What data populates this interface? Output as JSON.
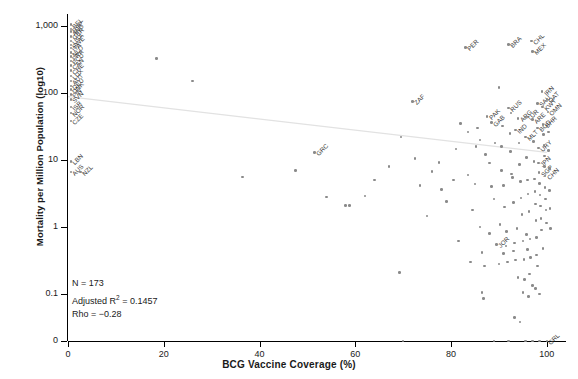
{
  "chart_data": {
    "type": "scatter",
    "title": "",
    "xlabel": "BCG Vaccine Coverage (%)",
    "ylabel": "Mortality per Million Population (log10)",
    "xlim": [
      0,
      104
    ],
    "ylim_log": [
      0.03,
      2000
    ],
    "xticks": [
      "0",
      "20",
      "40",
      "60",
      "80",
      "100"
    ],
    "xtick_values": [
      0,
      20,
      40,
      60,
      80,
      100
    ],
    "yticks": [
      "1,000",
      "100",
      "10",
      "1",
      "0.1",
      "0"
    ],
    "ytick_values": [
      1000,
      100,
      10,
      1,
      0.1,
      0
    ],
    "grid": false,
    "legend": "none",
    "trendline": {
      "type": "linear-fit-on-log10",
      "x_start": 0,
      "y_start": 88,
      "x_end": 100,
      "y_end": 13
    },
    "point_color": "#8a8a8a",
    "label_color": "#3a3a3a",
    "annotations": {
      "n_label": "N = 173",
      "r2_label_prefix": "Adjusted R",
      "r2_label_sup": "2",
      "r2_label_value": " = 0.1457",
      "rho_label": "Rho = −0.28"
    },
    "points": [
      {
        "x": 0.6,
        "y": 1050,
        "label": "BEL"
      },
      {
        "x": 0.6,
        "y": 900,
        "label": "ESP"
      },
      {
        "x": 0.6,
        "y": 820,
        "label": "AND"
      },
      {
        "x": 0.6,
        "y": 700,
        "label": "GBR"
      },
      {
        "x": 0.6,
        "y": 600,
        "label": "USA"
      },
      {
        "x": 0.6,
        "y": 520,
        "label": "SWE"
      },
      {
        "x": 0.6,
        "y": 470,
        "label": "ITA"
      },
      {
        "x": 0.6,
        "y": 400,
        "label": "NLD"
      },
      {
        "x": 0.6,
        "y": 350,
        "label": "FRA"
      },
      {
        "x": 0.6,
        "y": 300,
        "label": "ECU"
      },
      {
        "x": 0.6,
        "y": 255,
        "label": "CAN"
      },
      {
        "x": 0.6,
        "y": 215,
        "label": "CHE"
      },
      {
        "x": 0.6,
        "y": 180,
        "label": "LUX"
      },
      {
        "x": 0.6,
        "y": 150,
        "label": "AUT"
      },
      {
        "x": 0.6,
        "y": 128,
        "label": "DEU"
      },
      {
        "x": 0.6,
        "y": 112,
        "label": "DNK"
      },
      {
        "x": 0.6,
        "y": 95,
        "label": "FIN"
      },
      {
        "x": 0.6,
        "y": 80,
        "label": "SVN"
      },
      {
        "x": 0.6,
        "y": 62,
        "label": "ISR"
      },
      {
        "x": 0.6,
        "y": 50,
        "label": "NOR"
      },
      {
        "x": 0.6,
        "y": 38,
        "label": "CZE"
      },
      {
        "x": 0.6,
        "y": 9.5,
        "label": "LBN"
      },
      {
        "x": 0.6,
        "y": 6.6,
        "label": "AUS"
      },
      {
        "x": 2.6,
        "y": 6.6,
        "label": "NZL"
      },
      {
        "x": 18.5,
        "y": 330,
        "label": ""
      },
      {
        "x": 26.0,
        "y": 150,
        "label": ""
      },
      {
        "x": 36.5,
        "y": 5.6,
        "label": ""
      },
      {
        "x": 51.5,
        "y": 13.0,
        "label": "GRC"
      },
      {
        "x": 54.0,
        "y": 2.8,
        "label": ""
      },
      {
        "x": 58.0,
        "y": 2.1,
        "label": ""
      },
      {
        "x": 58.8,
        "y": 2.1,
        "label": ""
      },
      {
        "x": 62.0,
        "y": 2.9,
        "label": ""
      },
      {
        "x": 69.2,
        "y": 0.21,
        "label": ""
      },
      {
        "x": 72.0,
        "y": 75.0,
        "label": "ZAF"
      },
      {
        "x": 69.5,
        "y": 22.0,
        "label": ""
      },
      {
        "x": 72.5,
        "y": 10.5,
        "label": ""
      },
      {
        "x": 75.0,
        "y": 1.45,
        "label": ""
      },
      {
        "x": 77.5,
        "y": 9.2,
        "label": ""
      },
      {
        "x": 79.0,
        "y": 2.4,
        "label": ""
      },
      {
        "x": 81.0,
        "y": 14.5,
        "label": ""
      },
      {
        "x": 81.5,
        "y": 0.62,
        "label": ""
      },
      {
        "x": 83.0,
        "y": 480,
        "label": "PER"
      },
      {
        "x": 83.5,
        "y": 6.0,
        "label": ""
      },
      {
        "x": 84.5,
        "y": 1.8,
        "label": ""
      },
      {
        "x": 85.5,
        "y": 30.0,
        "label": ""
      },
      {
        "x": 85.0,
        "y": 4.4,
        "label": ""
      },
      {
        "x": 86.0,
        "y": 20.0,
        "label": ""
      },
      {
        "x": 86.5,
        "y": 0.105,
        "label": ""
      },
      {
        "x": 86.8,
        "y": 0.085,
        "label": ""
      },
      {
        "x": 87.5,
        "y": 45.0,
        "label": "PAK"
      },
      {
        "x": 88.5,
        "y": 36.0,
        "label": "GAB"
      },
      {
        "x": 88.0,
        "y": 9.0,
        "label": ""
      },
      {
        "x": 88.5,
        "y": 4.0,
        "label": ""
      },
      {
        "x": 89.0,
        "y": 2.6,
        "label": ""
      },
      {
        "x": 89.5,
        "y": 0.55,
        "label": "JOR"
      },
      {
        "x": 90.0,
        "y": 120,
        "label": ""
      },
      {
        "x": 90.5,
        "y": 16.0,
        "label": ""
      },
      {
        "x": 90.5,
        "y": 7.0,
        "label": ""
      },
      {
        "x": 91.0,
        "y": 4.2,
        "label": ""
      },
      {
        "x": 91.2,
        "y": 2.0,
        "label": ""
      },
      {
        "x": 91.5,
        "y": 0.52,
        "label": ""
      },
      {
        "x": 91.8,
        "y": 0.3,
        "label": ""
      },
      {
        "x": 92.0,
        "y": 530,
        "label": "BRA"
      },
      {
        "x": 92.0,
        "y": 60.0,
        "label": "RUS"
      },
      {
        "x": 92.3,
        "y": 25.0,
        "label": ""
      },
      {
        "x": 92.4,
        "y": 13.5,
        "label": ""
      },
      {
        "x": 92.6,
        "y": 6.2,
        "label": ""
      },
      {
        "x": 92.8,
        "y": 5.5,
        "label": ""
      },
      {
        "x": 93.0,
        "y": 2.3,
        "label": ""
      },
      {
        "x": 93.2,
        "y": 0.58,
        "label": ""
      },
      {
        "x": 93.4,
        "y": 0.32,
        "label": ""
      },
      {
        "x": 93.5,
        "y": 28.0,
        "label": "IND"
      },
      {
        "x": 94.0,
        "y": 42.0,
        "label": "ARG"
      },
      {
        "x": 94.2,
        "y": 18.0,
        "label": ""
      },
      {
        "x": 94.3,
        "y": 8.5,
        "label": ""
      },
      {
        "x": 94.5,
        "y": 4.8,
        "label": ""
      },
      {
        "x": 94.6,
        "y": 2.7,
        "label": ""
      },
      {
        "x": 94.8,
        "y": 1.55,
        "label": ""
      },
      {
        "x": 95.0,
        "y": 0.62,
        "label": ""
      },
      {
        "x": 95.2,
        "y": 0.33,
        "label": ""
      },
      {
        "x": 95.5,
        "y": 44.0,
        "label": "TUR"
      },
      {
        "x": 95.6,
        "y": 22.0,
        "label": "MLT"
      },
      {
        "x": 95.8,
        "y": 11.0,
        "label": ""
      },
      {
        "x": 96.0,
        "y": 5.0,
        "label": ""
      },
      {
        "x": 96.1,
        "y": 3.1,
        "label": ""
      },
      {
        "x": 96.3,
        "y": 1.7,
        "label": ""
      },
      {
        "x": 96.5,
        "y": 0.66,
        "label": ""
      },
      {
        "x": 96.6,
        "y": 0.35,
        "label": ""
      },
      {
        "x": 96.8,
        "y": 600,
        "label": "CHL"
      },
      {
        "x": 97.0,
        "y": 420,
        "label": "MEX"
      },
      {
        "x": 97.0,
        "y": 40.0,
        "label": "ARE"
      },
      {
        "x": 97.2,
        "y": 19.0,
        "label": ""
      },
      {
        "x": 97.3,
        "y": 9.5,
        "label": ""
      },
      {
        "x": 97.4,
        "y": 5.2,
        "label": ""
      },
      {
        "x": 97.5,
        "y": 3.4,
        "label": ""
      },
      {
        "x": 97.6,
        "y": 2.2,
        "label": ""
      },
      {
        "x": 97.7,
        "y": 1.25,
        "label": ""
      },
      {
        "x": 97.8,
        "y": 0.7,
        "label": ""
      },
      {
        "x": 97.9,
        "y": 0.38,
        "label": ""
      },
      {
        "x": 98.0,
        "y": 70.0,
        "label": "SAU"
      },
      {
        "x": 98.1,
        "y": 30.0,
        "label": "BGD"
      },
      {
        "x": 98.2,
        "y": 15.0,
        "label": "URY"
      },
      {
        "x": 98.3,
        "y": 9.0,
        "label": "JPN"
      },
      {
        "x": 98.4,
        "y": 6.5,
        "label": "SGP"
      },
      {
        "x": 98.5,
        "y": 4.5,
        "label": ""
      },
      {
        "x": 98.6,
        "y": 3.0,
        "label": ""
      },
      {
        "x": 98.7,
        "y": 2.05,
        "label": ""
      },
      {
        "x": 98.8,
        "y": 1.35,
        "label": ""
      },
      {
        "x": 98.9,
        "y": 0.9,
        "label": ""
      },
      {
        "x": 99.0,
        "y": 105,
        "label": "IRN"
      },
      {
        "x": 99.1,
        "y": 62.0,
        "label": "KWT"
      },
      {
        "x": 99.2,
        "y": 34.0,
        "label": "BHR"
      },
      {
        "x": 99.3,
        "y": 24.0,
        "label": ""
      },
      {
        "x": 99.4,
        "y": 16.5,
        "label": ""
      },
      {
        "x": 99.5,
        "y": 11.5,
        "label": ""
      },
      {
        "x": 99.5,
        "y": 8.0,
        "label": ""
      },
      {
        "x": 99.6,
        "y": 5.8,
        "label": "CHN"
      },
      {
        "x": 99.6,
        "y": 3.9,
        "label": ""
      },
      {
        "x": 99.7,
        "y": 2.6,
        "label": ""
      },
      {
        "x": 99.8,
        "y": 1.8,
        "label": ""
      },
      {
        "x": 99.9,
        "y": 1.15,
        "label": ""
      },
      {
        "x": 100.0,
        "y": 80.0,
        "label": "QAT"
      },
      {
        "x": 100.2,
        "y": 52.0,
        "label": "OMN"
      },
      {
        "x": 100.3,
        "y": 26.0,
        "label": ""
      },
      {
        "x": 100.4,
        "y": 14.0,
        "label": ""
      },
      {
        "x": 100.5,
        "y": 7.5,
        "label": ""
      },
      {
        "x": 100.6,
        "y": 3.5,
        "label": ""
      },
      {
        "x": 100.7,
        "y": 1.9,
        "label": ""
      },
      {
        "x": 100.8,
        "y": 0.95,
        "label": ""
      },
      {
        "x": 95.0,
        "y": 0.105,
        "label": ""
      },
      {
        "x": 96.2,
        "y": 0.092,
        "label": ""
      },
      {
        "x": 97.0,
        "y": 0.135,
        "label": ""
      },
      {
        "x": 97.6,
        "y": 0.12,
        "label": ""
      },
      {
        "x": 98.5,
        "y": 0.1,
        "label": ""
      },
      {
        "x": 94.0,
        "y": 0.175,
        "label": ""
      },
      {
        "x": 95.3,
        "y": 0.165,
        "label": ""
      },
      {
        "x": 96.4,
        "y": 0.2,
        "label": ""
      },
      {
        "x": 93.2,
        "y": 0.045,
        "label": ""
      },
      {
        "x": 94.4,
        "y": 0.038,
        "label": ""
      },
      {
        "x": 89.0,
        "y": 0.0,
        "label": ""
      },
      {
        "x": 92.0,
        "y": 0.0,
        "label": ""
      },
      {
        "x": 95.5,
        "y": 0.0,
        "label": ""
      },
      {
        "x": 97.0,
        "y": 0.0,
        "label": ""
      },
      {
        "x": 98.5,
        "y": 0.0,
        "label": ""
      },
      {
        "x": 100.0,
        "y": 0.0,
        "label": "GRL"
      },
      {
        "x": 70.0,
        "y": 0.0,
        "label": ""
      },
      {
        "x": 86.0,
        "y": 1.0,
        "label": ""
      },
      {
        "x": 88.0,
        "y": 0.8,
        "label": ""
      },
      {
        "x": 90.2,
        "y": 1.1,
        "label": ""
      },
      {
        "x": 91.6,
        "y": 0.85,
        "label": ""
      },
      {
        "x": 93.8,
        "y": 0.95,
        "label": ""
      },
      {
        "x": 95.8,
        "y": 0.78,
        "label": ""
      },
      {
        "x": 86.5,
        "y": 0.42,
        "label": ""
      },
      {
        "x": 91.0,
        "y": 0.4,
        "label": ""
      },
      {
        "x": 93.0,
        "y": 0.44,
        "label": ""
      },
      {
        "x": 96.0,
        "y": 0.46,
        "label": ""
      },
      {
        "x": 99.2,
        "y": 0.48,
        "label": ""
      },
      {
        "x": 84.0,
        "y": 0.3,
        "label": ""
      },
      {
        "x": 87.0,
        "y": 0.26,
        "label": ""
      },
      {
        "x": 90.0,
        "y": 0.28,
        "label": ""
      },
      {
        "x": 98.0,
        "y": 0.26,
        "label": ""
      },
      {
        "x": 92.5,
        "y": 50.0,
        "label": ""
      },
      {
        "x": 90.8,
        "y": 32.0,
        "label": ""
      },
      {
        "x": 89.2,
        "y": 18.0,
        "label": ""
      },
      {
        "x": 87.2,
        "y": 12.0,
        "label": ""
      },
      {
        "x": 85.2,
        "y": 16.0,
        "label": ""
      },
      {
        "x": 83.5,
        "y": 26.0,
        "label": ""
      },
      {
        "x": 82.0,
        "y": 35.0,
        "label": ""
      },
      {
        "x": 80.5,
        "y": 5.0,
        "label": ""
      },
      {
        "x": 78.0,
        "y": 3.6,
        "label": ""
      },
      {
        "x": 76.0,
        "y": 6.8,
        "label": ""
      },
      {
        "x": 73.5,
        "y": 4.2,
        "label": ""
      },
      {
        "x": 67.0,
        "y": 8.0,
        "label": ""
      },
      {
        "x": 64.0,
        "y": 5.0,
        "label": ""
      },
      {
        "x": 47.5,
        "y": 7.0,
        "label": ""
      }
    ]
  }
}
